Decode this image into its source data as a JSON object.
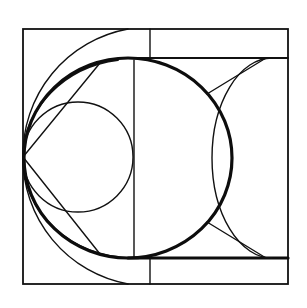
{
  "diagram": {
    "title": "",
    "stroke_color": "#111111",
    "background_color": "#ffffff",
    "elements": [
      {
        "name": "outer-square",
        "kind": "rectangle"
      },
      {
        "name": "inner-band-top-line",
        "kind": "line"
      },
      {
        "name": "inner-band-bottom-line",
        "kind": "line"
      },
      {
        "name": "top-divider",
        "kind": "line"
      },
      {
        "name": "bottom-divider",
        "kind": "line"
      },
      {
        "name": "center-vertical",
        "kind": "line"
      },
      {
        "name": "large-circle",
        "kind": "circle"
      },
      {
        "name": "small-circle",
        "kind": "circle"
      },
      {
        "name": "outer-left-arc",
        "kind": "arc"
      },
      {
        "name": "right-semicircle",
        "kind": "arc"
      },
      {
        "name": "tangent-lines",
        "kind": "line"
      }
    ]
  }
}
